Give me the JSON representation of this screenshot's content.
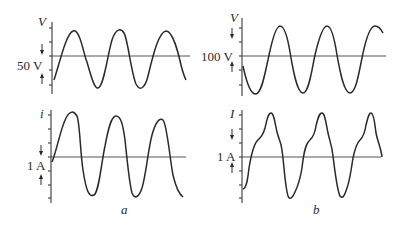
{
  "figure": {
    "panels": [
      {
        "id": "a",
        "caption": "a",
        "voltage": {
          "axis_label": "V",
          "scale_label": "50 V",
          "scale_value": 50,
          "unit": "V",
          "waveform": "sinusoidal"
        },
        "current": {
          "axis_label": "i",
          "scale_label": "1 A",
          "scale_value": 1,
          "unit": "A",
          "waveform": "near-sinusoidal"
        }
      },
      {
        "id": "b",
        "caption": "b",
        "voltage": {
          "axis_label": "V",
          "scale_label": "100 V",
          "scale_value": 100,
          "unit": "V",
          "waveform": "sinusoidal"
        },
        "current": {
          "axis_label": "I",
          "scale_label": "1 A",
          "scale_value": 1,
          "unit": "A",
          "waveform": "distorted (harmonics)"
        }
      }
    ],
    "colors": {
      "line": "#2a2a2a",
      "axis": "#3a3a3a",
      "background": "#ffffff"
    }
  }
}
